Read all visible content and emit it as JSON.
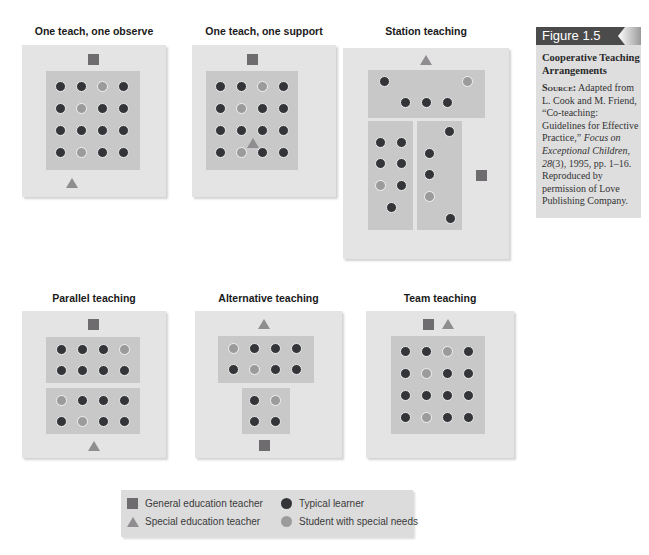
{
  "colors": {
    "panel_bg": "#e4e4e4",
    "group_bg": "#c8c8c8",
    "typical_learner": "#333538",
    "special_needs": "#9b9b9b",
    "general_teacher": "#6e6c6e",
    "special_teacher": "#8f8d8f",
    "figure_header": "#4b4b4b"
  },
  "figure": {
    "label": "Figure 1.5",
    "title": "Cooperative Teaching Arrangements",
    "source_label": "Source:",
    "source_text_1": " Adapted from L. Cook and M. Friend, “Co-teaching: Guidelines for Effective Practice,” ",
    "source_journal": "Focus on Exceptional Children, 28",
    "source_text_2": "(3), 1995, pp. 1–16. Reproduced by permission of Love Publishing Company."
  },
  "panels": [
    {
      "id": "one-teach-one-observe",
      "title": "One teach, one observe",
      "grid": [
        [
          "T",
          "T",
          "S",
          "T"
        ],
        [
          "T",
          "S",
          "T",
          "T"
        ],
        [
          "T",
          "T",
          "T",
          "T"
        ],
        [
          "T",
          "S",
          "T",
          "T"
        ]
      ],
      "general_teacher": "top-center",
      "special_teacher": "bottom-left"
    },
    {
      "id": "one-teach-one-support",
      "title": "One teach, one support",
      "grid": [
        [
          "T",
          "T",
          "S",
          "T"
        ],
        [
          "T",
          "S",
          "T",
          "T"
        ],
        [
          "T",
          "T",
          "T",
          "T"
        ],
        [
          "T",
          "S",
          "T",
          "T"
        ]
      ],
      "general_teacher": "top-center",
      "special_teacher": "among students (row 3-4, col 2-3)"
    },
    {
      "id": "station-teaching",
      "title": "Station teaching",
      "stations": [
        {
          "name": "top",
          "students": [
            "T",
            "S",
            "T",
            "T",
            "T"
          ]
        },
        {
          "name": "bottom-left",
          "students": [
            "T",
            "T",
            "T",
            "T",
            "S",
            "T",
            "T"
          ]
        },
        {
          "name": "bottom-right",
          "students": [
            "T",
            "T",
            "T",
            "S",
            "T"
          ]
        }
      ],
      "general_teacher": "right-side",
      "special_teacher": "top-center"
    },
    {
      "id": "parallel-teaching",
      "title": "Parallel teaching",
      "groups": [
        {
          "grid": [
            [
              "T",
              "T",
              "T",
              "S"
            ],
            [
              "T",
              "T",
              "T",
              "T"
            ]
          ]
        },
        {
          "grid": [
            [
              "S",
              "T",
              "T",
              "T"
            ],
            [
              "T",
              "S",
              "T",
              "T"
            ]
          ]
        }
      ],
      "general_teacher": "top-center",
      "special_teacher": "bottom-center"
    },
    {
      "id": "alternative-teaching",
      "title": "Alternative teaching",
      "groups": [
        {
          "grid": [
            [
              "S",
              "T",
              "T",
              "T"
            ],
            [
              "T",
              "S",
              "T",
              "T"
            ]
          ]
        },
        {
          "grid": [
            [
              "T",
              "S"
            ],
            [
              "T",
              "T"
            ]
          ]
        }
      ],
      "general_teacher": "bottom-center",
      "special_teacher": "top-center"
    },
    {
      "id": "team-teaching",
      "title": "Team teaching",
      "grid": [
        [
          "T",
          "T",
          "S",
          "T"
        ],
        [
          "T",
          "S",
          "T",
          "T"
        ],
        [
          "T",
          "T",
          "T",
          "T"
        ],
        [
          "T",
          "S",
          "T",
          "T"
        ]
      ],
      "general_teacher": "top-center-left",
      "special_teacher": "top-center-right"
    }
  ],
  "legend": {
    "general_teacher": "General education teacher",
    "special_teacher": "Special education teacher",
    "typical_learner": "Typical learner",
    "special_needs": "Student with special needs"
  }
}
